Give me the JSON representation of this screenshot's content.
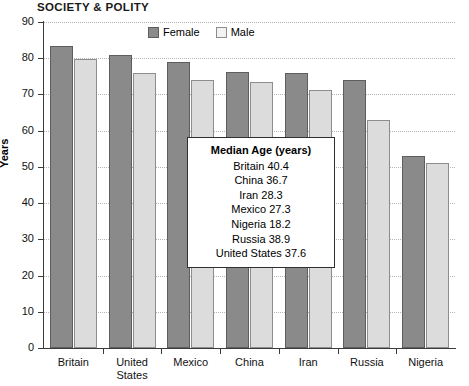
{
  "section_header": "SOCIETY & POLITY",
  "legend": {
    "position": "top-center",
    "items": [
      {
        "label": "Female",
        "color": "#8a8a8a",
        "name": "legend-female"
      },
      {
        "label": "Male",
        "color": "#f2f2f2",
        "name": "legend-male"
      }
    ]
  },
  "callout": {
    "title": "Median Age (years)",
    "rows": [
      "Britain 40.4",
      "China 36.7",
      "Iran 28.3",
      "Mexico 27.3",
      "Nigeria 18.2",
      "Russia 38.9",
      "United States 37.6"
    ]
  },
  "chart_data": {
    "type": "bar",
    "title": "",
    "subtitle": "",
    "xlabel": "",
    "ylabel": "Years",
    "ylim": [
      0,
      90
    ],
    "ytick_step": 10,
    "yticks": [
      0,
      10,
      20,
      30,
      40,
      50,
      60,
      70,
      80,
      90
    ],
    "ytick_labels": [
      "0",
      "10",
      "20",
      "30",
      "40",
      "50",
      "60",
      "70",
      "80",
      "90"
    ],
    "grid": true,
    "grid_axis": "y",
    "legend_position": "top-center",
    "categories": [
      "Britain",
      "United States",
      "Mexico",
      "China",
      "Iran",
      "Russia",
      "Nigeria"
    ],
    "category_labels": [
      [
        "Britain"
      ],
      [
        "United",
        "States"
      ],
      [
        "Mexico"
      ],
      [
        "China"
      ],
      [
        "Iran"
      ],
      [
        "Russia"
      ],
      [
        "Nigeria"
      ]
    ],
    "series": [
      {
        "name": "Female",
        "color": "#8a8a8a",
        "values": [
          83.5,
          81.0,
          79.0,
          76.3,
          76.0,
          74.0,
          53.0
        ]
      },
      {
        "name": "Male",
        "color": "#dcdcdc",
        "values": [
          79.7,
          76.0,
          74.0,
          73.5,
          71.3,
          63.0,
          51.0
        ]
      }
    ]
  }
}
